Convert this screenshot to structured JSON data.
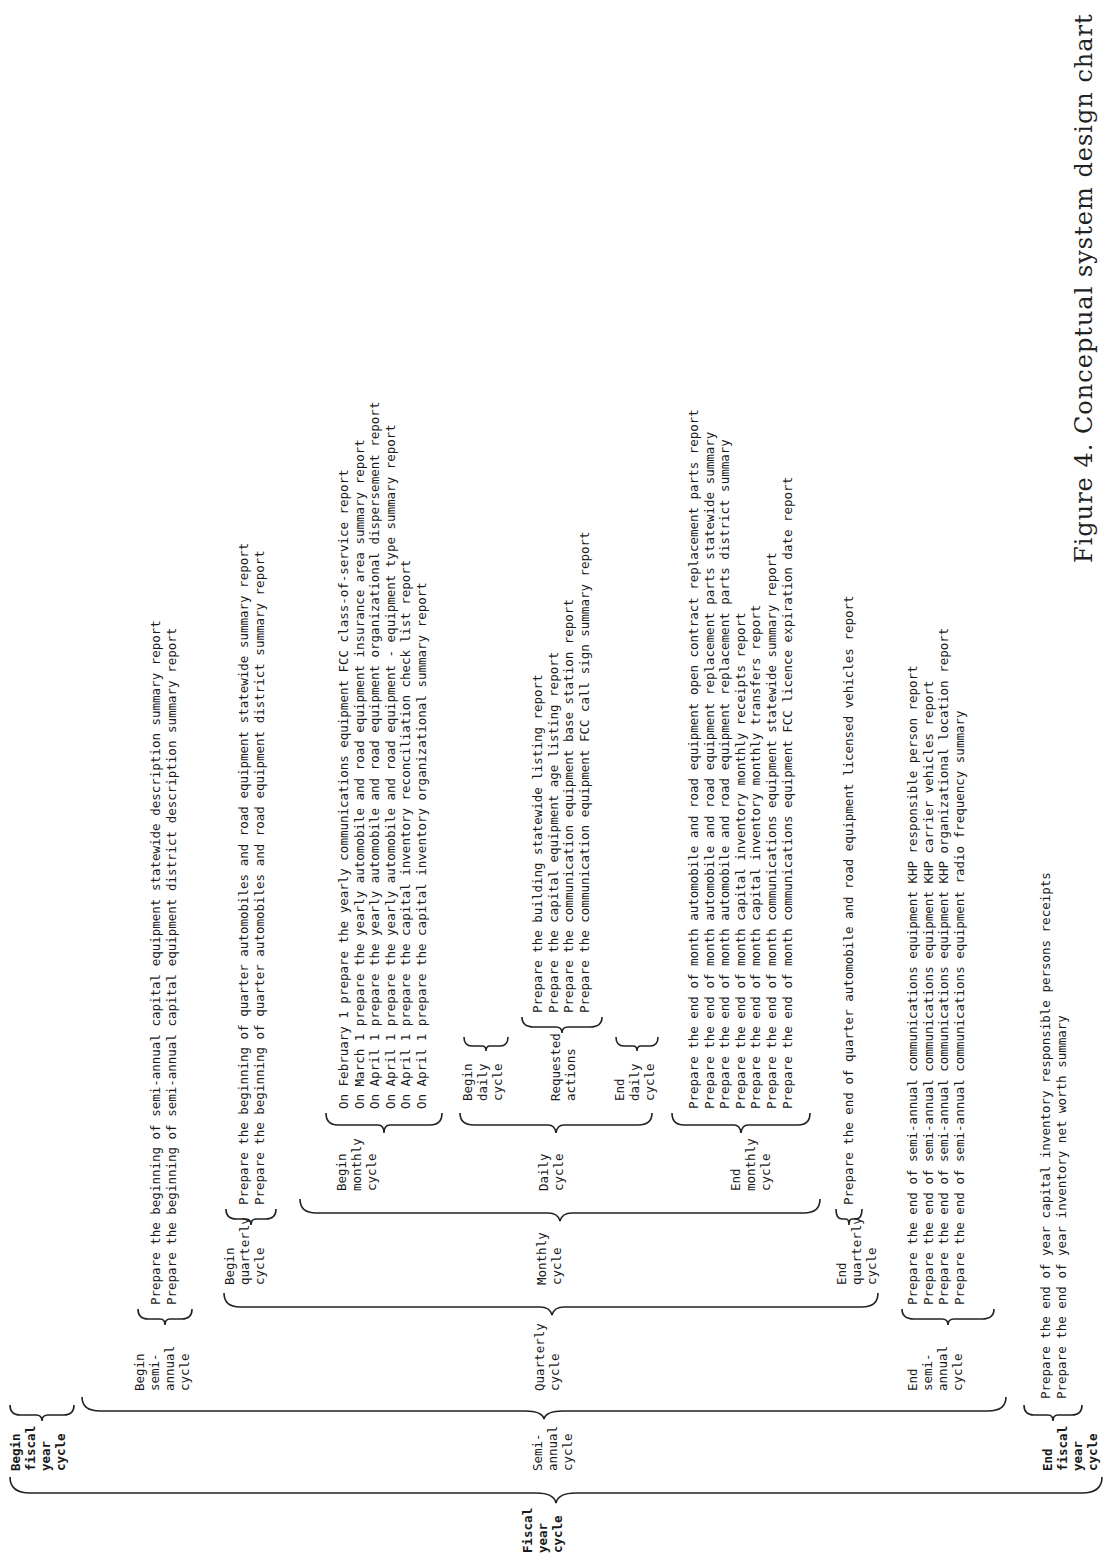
{
  "root": {
    "label": "Fiscal\nyear\ncycle"
  },
  "level1": {
    "begin_fiscal": "Begin\nfiscal\nyear\ncycle",
    "semi_annual": "Semi-\nannual\ncycle",
    "end_fiscal": "End\nfiscal\nyear\ncycle"
  },
  "level2": {
    "begin_semi": "Begin\nsemi-\nannual\ncycle",
    "quarterly": "Quarterly\ncycle",
    "end_semi": "End\nsemi-\nannual\ncycle"
  },
  "level3": {
    "begin_quarterly": "Begin\nquarterly\ncycle",
    "monthly": "Monthly\ncycle",
    "end_quarterly": "End\nquarterly\ncycle"
  },
  "level4": {
    "begin_monthly": "Begin\nmonthly\ncycle",
    "daily": "Daily\ncycle",
    "end_monthly": "End\nmonthly\ncycle"
  },
  "level5": {
    "begin_daily": "Begin\ndaily\ncycle",
    "requested": "Requested\nactions",
    "end_daily": "End\ndaily\ncycle"
  },
  "reports": {
    "begin_semi": [
      "Prepare the beginning of semi-annual capital equipment statewide description summary report",
      "Prepare the beginning of semi-annual capital equipment district description summary report"
    ],
    "begin_quarterly": [
      "Prepare the beginning of quarter automobiles and road equipment statewide summary report",
      "Prepare the beginning of quarter automobiles and road equipment district summary report"
    ],
    "begin_monthly": [
      "On February 1 prepare the yearly communications equipment FCC class-of-service report",
      "On March 1 prepare the yearly automobile and road equipment insurance area summary report",
      "On April 1 prepare the yearly automobile and road equipment organizational dispersement report",
      "On April 1 prepare the yearly automobile and road equipment - equipment type summary report",
      "On April 1 prepare the capital inventory reconciliation check list report",
      "On April 1 prepare the capital inventory organizational summary report"
    ],
    "requested": [
      "Prepare the building statewide listing report",
      "Prepare the capital equipment age listing report",
      "Prepare the communication equipment base station report",
      "Prepare the communication equipment FCC call sign summary report"
    ],
    "end_monthly": [
      "Prepare the end of month automobile and road equipment open contract replacement parts report",
      "Prepare the end of month automobile and road equipment replacement parts statewide summary",
      "Prepare the end of month automobile and road equipment replacement parts district summary",
      "Prepare the end of month capital inventory monthly receipts report",
      "Prepare the end of month capital inventory monthly transfers report",
      "Prepare the end of month communications equipment statewide summary report",
      "Prepare the end of month communications equipment FCC licence expiration date report"
    ],
    "end_quarterly": [
      "Prepare the end of quarter automobile and road equipment licensed vehicles report"
    ],
    "end_semi": [
      "Prepare the end of semi-annual communications equipment KHP responsible person report",
      "Prepare the end of semi-annual communications equipment KHP carrier vehicles report",
      "Prepare the end of semi-annual communications equipment KHP organizational location report",
      "Prepare the end of semi-annual communications equipment radio frequency summary"
    ],
    "end_fiscal": [
      "Prepare the end of year capital inventory responsible persons receipts",
      "Prepare the end of year inventory net worth summary"
    ]
  },
  "caption": "Figure 4. Conceptual system design chart"
}
